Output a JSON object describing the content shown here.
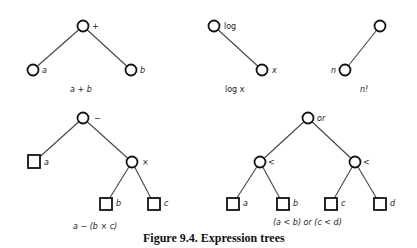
{
  "figure_caption": "Figure 9.4.  Expression trees",
  "trees": [
    {
      "caption": "a + b",
      "nodes": [
        {
          "id": "plus",
          "shape": "circle",
          "label": "+",
          "x": 83,
          "y": 26
        },
        {
          "id": "a",
          "shape": "circle",
          "label": "a",
          "x": 33,
          "y": 70
        },
        {
          "id": "b",
          "shape": "circle",
          "label": "b",
          "x": 131,
          "y": 70
        }
      ],
      "edges": [
        [
          "plus",
          "a"
        ],
        [
          "plus",
          "b"
        ]
      ]
    },
    {
      "caption": "log x",
      "nodes": [
        {
          "id": "log",
          "shape": "circle",
          "label": "log",
          "x": 214,
          "y": 26
        },
        {
          "id": "x",
          "shape": "circle",
          "label": "x",
          "x": 262,
          "y": 70
        }
      ],
      "edges": [
        [
          "log",
          "x"
        ]
      ]
    },
    {
      "caption": "n!",
      "nodes": [
        {
          "id": "fact",
          "shape": "circle",
          "label": "!",
          "x": 380,
          "y": 26
        },
        {
          "id": "n",
          "shape": "circle",
          "label": "n",
          "x": 345,
          "y": 70
        }
      ],
      "edges": [
        [
          "fact",
          "n"
        ]
      ]
    },
    {
      "caption": "a − (b × c)",
      "nodes": [
        {
          "id": "minus",
          "shape": "circle",
          "label": "−",
          "x": 83,
          "y": 118
        },
        {
          "id": "a",
          "shape": "square",
          "label": "a",
          "x": 34,
          "y": 162
        },
        {
          "id": "times",
          "shape": "circle",
          "label": "×",
          "x": 132,
          "y": 162
        },
        {
          "id": "b",
          "shape": "square",
          "label": "b",
          "x": 106,
          "y": 204
        },
        {
          "id": "c",
          "shape": "square",
          "label": "c",
          "x": 154,
          "y": 204
        }
      ],
      "edges": [
        [
          "minus",
          "a"
        ],
        [
          "minus",
          "times"
        ],
        [
          "times",
          "b"
        ],
        [
          "times",
          "c"
        ]
      ]
    },
    {
      "caption": "(a < b) or (c < d)",
      "nodes": [
        {
          "id": "or",
          "shape": "circle",
          "label": "or",
          "x": 308,
          "y": 118
        },
        {
          "id": "lt1",
          "shape": "circle",
          "label": "<",
          "x": 260,
          "y": 162
        },
        {
          "id": "lt2",
          "shape": "circle",
          "label": "<",
          "x": 355,
          "y": 162
        },
        {
          "id": "a",
          "shape": "square",
          "label": "a",
          "x": 233,
          "y": 204
        },
        {
          "id": "b",
          "shape": "square",
          "label": "b",
          "x": 283,
          "y": 204
        },
        {
          "id": "c",
          "shape": "square",
          "label": "c",
          "x": 331,
          "y": 204
        },
        {
          "id": "d",
          "shape": "square",
          "label": "d",
          "x": 380,
          "y": 204
        }
      ],
      "edges": [
        [
          "or",
          "lt1"
        ],
        [
          "or",
          "lt2"
        ],
        [
          "lt1",
          "a"
        ],
        [
          "lt1",
          "b"
        ],
        [
          "lt2",
          "c"
        ],
        [
          "lt2",
          "d"
        ]
      ]
    }
  ]
}
